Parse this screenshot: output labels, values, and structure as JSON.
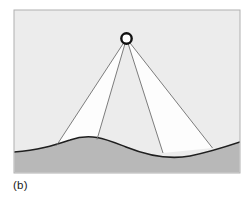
{
  "figure": {
    "caption": "(b)",
    "panel_label": "(b)",
    "colors": {
      "page_background": "#ffffff",
      "panel_background": "#ececec",
      "panel_border": "#b0b0b0",
      "terrain_fill": "#b8b8b8",
      "terrain_outline": "#1f1f1f",
      "beam_fill": "#fdfdfd",
      "beam_edge": "#6e6e6e",
      "source_stroke": "#111111",
      "source_fill": "#ffffff",
      "caption_color": "#1a1a1a"
    },
    "panel": {
      "x": 14,
      "y": 10,
      "width": 226,
      "height": 163
    },
    "source": {
      "label": "point-light-source",
      "cx": 126.5,
      "cy": 38.5,
      "radius": 5.2,
      "stroke_width": 2.4
    },
    "terrain": {
      "label": "ground-profile",
      "path": "M 14 152 C 38 150 52 146 70 140 C 92 132 108 140 126 147 C 146 155 168 160 190 156 C 210 152 228 146 240 142 L 240 173 L 14 173 Z",
      "outline_path": "M 14 152 C 38 150 52 146 70 140 C 92 132 108 140 126 147 C 146 155 168 160 190 156 C 210 152 228 146 240 142",
      "outline_width": 1.6
    },
    "beams": [
      {
        "label": "beam-left",
        "path": "M 126.5 38.5 L 56.5 145.5 L 97 139.5 Z",
        "apex": {
          "x": 126.5,
          "y": 38.5
        },
        "ground_left": {
          "x": 56.5,
          "y": 145.5
        },
        "ground_right": {
          "x": 97,
          "y": 139.5
        }
      },
      {
        "label": "beam-right",
        "path": "M 126.5 38.5 L 163 153 L 212.5 148 Z",
        "apex": {
          "x": 126.5,
          "y": 38.5
        },
        "ground_left": {
          "x": 163,
          "y": 153
        },
        "ground_right": {
          "x": 212.5,
          "y": 148
        }
      }
    ],
    "rays": [
      {
        "label": "ray-1",
        "x1": 126.5,
        "y1": 38.5,
        "x2": 56.5,
        "y2": 145.5
      },
      {
        "label": "ray-2",
        "x1": 126.5,
        "y1": 38.5,
        "x2": 97,
        "y2": 139.5
      },
      {
        "label": "ray-3",
        "x1": 126.5,
        "y1": 38.5,
        "x2": 163,
        "y2": 153
      },
      {
        "label": "ray-4",
        "x1": 126.5,
        "y1": 38.5,
        "x2": 212.5,
        "y2": 148
      }
    ]
  }
}
